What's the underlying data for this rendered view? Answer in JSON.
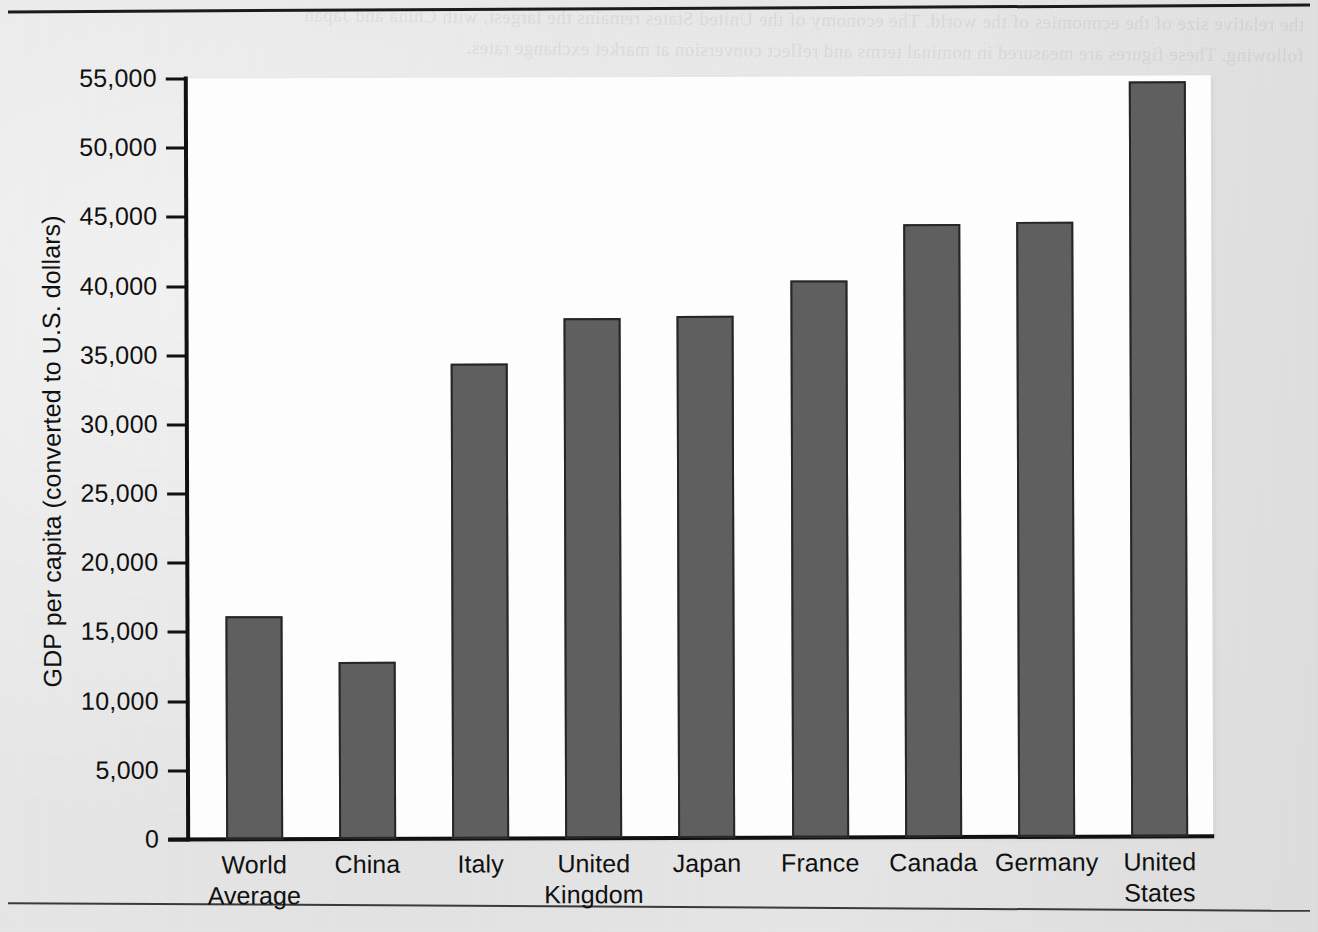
{
  "chart_data": {
    "type": "bar",
    "title": "",
    "subtitle": "",
    "xlabel": "",
    "ylabel": "GDP per capita (converted to U.S. dollars)",
    "categories": [
      "World Average",
      "China",
      "Italy",
      "United Kingdom",
      "Japan",
      "France",
      "Canada",
      "Germany",
      "United States"
    ],
    "category_lines": [
      [
        "World",
        "Average"
      ],
      [
        "China"
      ],
      [
        "Italy"
      ],
      [
        "United",
        "Kingdom"
      ],
      [
        "Japan"
      ],
      [
        "France"
      ],
      [
        "Canada"
      ],
      [
        "Germany"
      ],
      [
        "United",
        "States"
      ]
    ],
    "values": [
      16100,
      12800,
      34300,
      37600,
      37750,
      40250,
      44300,
      44450,
      54550
    ],
    "ylim": [
      0,
      55000
    ],
    "ytick_values": [
      0,
      5000,
      10000,
      15000,
      20000,
      25000,
      30000,
      35000,
      40000,
      45000,
      50000,
      55000
    ],
    "ytick_labels": [
      "0",
      "5,000",
      "10,000",
      "15,000",
      "20,000",
      "25,000",
      "30,000",
      "35,000",
      "40,000",
      "45,000",
      "50,000",
      "55,000"
    ],
    "grid": false,
    "legend": null,
    "legend_position": "none",
    "annotations": [],
    "bar_color": "#5f5f5f",
    "bar_edge_color": "#262626",
    "axis_color": "#111111",
    "plot_background": "#fdfdfd",
    "page_background": "#e6e6e6"
  },
  "page": {
    "top_rule": "",
    "bottom_rule": "",
    "ghost_text": "the relative size of the economies of the world. The economy of the United States remains the largest, with China and Japan following. These figures are measured in nominal terms and reflect conversion at market exchange rates."
  }
}
